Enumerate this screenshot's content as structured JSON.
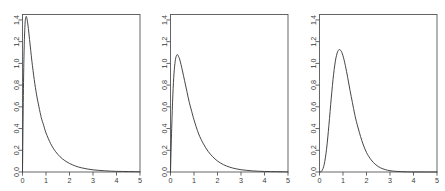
{
  "figure": {
    "background_color": "#ffffff",
    "axis_color": "#555555",
    "curve_color": "#3c3c3c",
    "panel_count": 3
  },
  "chart_data": [
    {
      "type": "line",
      "title": "",
      "subtitle": "",
      "xlabel": "",
      "ylabel": "",
      "xlim": [
        0,
        5
      ],
      "ylim": [
        0,
        1.45
      ],
      "grid": false,
      "legend": "none",
      "panel_index": 1,
      "description": "Sharply peaked right-skewed density; near-vertical rise then rapid monotone decay toward zero.",
      "peak": {
        "x": 0.15,
        "y": 1.43
      },
      "xticks": [
        0,
        1,
        2,
        3,
        4,
        5
      ],
      "xtick_labels": [
        "0",
        "1",
        "2",
        "3",
        "4",
        "5"
      ],
      "yticks": [
        0.0,
        0.2,
        0.4,
        0.6,
        0.8,
        1.0,
        1.2,
        1.4
      ],
      "ytick_labels": [
        "0.0",
        "0.2",
        "0.4",
        "0.6",
        "0.8",
        "1.0",
        "1.2",
        "1.4"
      ],
      "x": [
        0.0,
        0.05,
        0.1,
        0.15,
        0.2,
        0.25,
        0.3,
        0.35,
        0.4,
        0.5,
        0.6,
        0.7,
        0.8,
        0.9,
        1.0,
        1.2,
        1.4,
        1.6,
        1.8,
        2.0,
        2.25,
        2.5,
        2.75,
        3.0,
        3.25,
        3.5,
        3.75,
        4.0,
        4.25,
        4.5,
        4.75,
        5.0
      ],
      "y": [
        0.0,
        0.92,
        1.33,
        1.43,
        1.4,
        1.32,
        1.22,
        1.12,
        1.02,
        0.85,
        0.71,
        0.6,
        0.5,
        0.43,
        0.36,
        0.26,
        0.19,
        0.14,
        0.105,
        0.079,
        0.055,
        0.039,
        0.028,
        0.02,
        0.015,
        0.011,
        0.008,
        0.006,
        0.005,
        0.004,
        0.003,
        0.002
      ]
    },
    {
      "type": "line",
      "title": "",
      "subtitle": "",
      "xlabel": "",
      "ylabel": "",
      "xlim": [
        0,
        5
      ],
      "ylim": [
        0,
        1.45
      ],
      "grid": false,
      "legend": "none",
      "panel_index": 2,
      "description": "Right-skewed unimodal density with interior mode near x=0.3 and long right tail.",
      "peak": {
        "x": 0.3,
        "y": 1.08
      },
      "xticks": [
        0,
        1,
        2,
        3,
        4,
        5
      ],
      "xtick_labels": [
        "0",
        "1",
        "2",
        "3",
        "4",
        "5"
      ],
      "yticks": [
        0.0,
        0.2,
        0.4,
        0.6,
        0.8,
        1.0,
        1.2,
        1.4
      ],
      "ytick_labels": [
        "0.0",
        "0.2",
        "0.4",
        "0.6",
        "0.8",
        "1.0",
        "1.2",
        "1.4"
      ],
      "x": [
        0.0,
        0.05,
        0.1,
        0.15,
        0.2,
        0.25,
        0.3,
        0.35,
        0.4,
        0.5,
        0.6,
        0.7,
        0.8,
        0.9,
        1.0,
        1.2,
        1.4,
        1.6,
        1.8,
        2.0,
        2.25,
        2.5,
        2.75,
        3.0,
        3.25,
        3.5,
        3.75,
        4.0,
        4.25,
        4.5,
        4.75,
        5.0
      ],
      "y": [
        0.0,
        0.4,
        0.71,
        0.91,
        1.02,
        1.07,
        1.08,
        1.06,
        1.03,
        0.94,
        0.84,
        0.74,
        0.64,
        0.56,
        0.48,
        0.35,
        0.26,
        0.19,
        0.14,
        0.101,
        0.068,
        0.046,
        0.031,
        0.021,
        0.015,
        0.01,
        0.007,
        0.005,
        0.004,
        0.003,
        0.002,
        0.001
      ]
    },
    {
      "type": "line",
      "title": "",
      "subtitle": "",
      "xlabel": "",
      "ylabel": "",
      "xlim": [
        0,
        5
      ],
      "ylim": [
        0,
        1.45
      ],
      "grid": false,
      "legend": "none",
      "panel_index": 3,
      "description": "Smooth bell-like right-skewed density with mode near x=0.8, effectively zero beyond x=3.",
      "peak": {
        "x": 0.8,
        "y": 1.12
      },
      "xticks": [
        0,
        1,
        2,
        3,
        4,
        5
      ],
      "xtick_labels": [
        "0",
        "1",
        "2",
        "3",
        "4",
        "5"
      ],
      "yticks": [
        0.0,
        0.2,
        0.4,
        0.6,
        0.8,
        1.0,
        1.2,
        1.4
      ],
      "ytick_labels": [
        "0.0",
        "0.2",
        "0.4",
        "0.6",
        "0.8",
        "1.0",
        "1.2",
        "1.4"
      ],
      "x": [
        0.0,
        0.1,
        0.2,
        0.3,
        0.4,
        0.5,
        0.6,
        0.7,
        0.8,
        0.9,
        1.0,
        1.1,
        1.2,
        1.3,
        1.4,
        1.5,
        1.6,
        1.8,
        2.0,
        2.2,
        2.4,
        2.6,
        2.8,
        3.0,
        3.25,
        3.5,
        3.75,
        4.0,
        4.5,
        5.0
      ],
      "y": [
        0.0,
        0.01,
        0.07,
        0.21,
        0.43,
        0.68,
        0.9,
        1.05,
        1.12,
        1.12,
        1.07,
        0.98,
        0.87,
        0.75,
        0.64,
        0.53,
        0.44,
        0.29,
        0.18,
        0.111,
        0.066,
        0.038,
        0.022,
        0.012,
        0.006,
        0.003,
        0.0015,
        0.0007,
        0.0002,
        0.0001
      ]
    }
  ]
}
